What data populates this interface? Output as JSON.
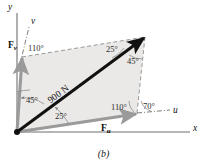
{
  "figure": {
    "caption": "(b)",
    "axes": [
      {
        "name": "y-axis",
        "label": "y"
      },
      {
        "name": "x-axis",
        "label": "x"
      },
      {
        "name": "u-axis",
        "label": "u"
      },
      {
        "name": "v-axis",
        "label": "v"
      }
    ],
    "vectors": [
      {
        "name": "resultant",
        "label": "900 N",
        "color": "#111111"
      },
      {
        "name": "component-u",
        "label": "F",
        "subscript": "u",
        "color": "#9a9a9a"
      },
      {
        "name": "component-v",
        "label": "F",
        "subscript": "v",
        "color": "#9a9a9a"
      }
    ],
    "angles": [
      {
        "name": "angle-v-from-y",
        "label": "110°"
      },
      {
        "name": "angle-v-from-resultant",
        "label": "45°"
      },
      {
        "name": "angle-resultant-from-u",
        "label": "25°"
      },
      {
        "name": "angle-top-25",
        "label": "25°"
      },
      {
        "name": "angle-top-45",
        "label": "45°"
      },
      {
        "name": "angle-u-interior-110",
        "label": "110°"
      },
      {
        "name": "angle-u-from-x",
        "label": "70°"
      }
    ],
    "colors": {
      "fill": "#ebe9e7",
      "outline": "#8c8c8c",
      "vector_dark": "#111111",
      "vector_gray": "#9a9a9a",
      "axis": "#6f6f6f"
    }
  }
}
